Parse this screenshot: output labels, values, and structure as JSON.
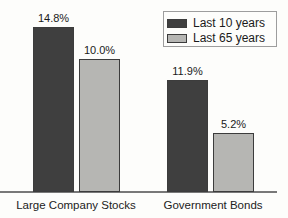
{
  "chart_data": {
    "type": "bar",
    "title": "",
    "xlabel": "",
    "ylabel": "",
    "grid": false,
    "legend_position": "top-right",
    "categories": [
      "Large Company Stocks",
      "Government Bonds"
    ],
    "series": [
      {
        "name": "Last 10 years",
        "color": "#3f3f3f",
        "values": [
          14.8,
          11.9
        ]
      },
      {
        "name": "Last 65 years",
        "color": "#b6b6b3",
        "values": [
          10.0,
          5.2
        ]
      }
    ],
    "value_labels": {
      "Last 10 years": [
        "14.8%",
        "11.9%"
      ],
      "Last 65 years": [
        "10.0%",
        "5.2%"
      ]
    },
    "ylim": [
      0,
      16
    ],
    "layout_px": {
      "baseline_y": 192,
      "bar_label_gap": 15,
      "bars": [
        {
          "series": 0,
          "category": 0,
          "label": "14.8%",
          "x": 33,
          "width": 41,
          "height": 165
        },
        {
          "series": 1,
          "category": 0,
          "label": "10.0%",
          "x": 79,
          "width": 41,
          "height": 133
        },
        {
          "series": 0,
          "category": 1,
          "label": "11.9%",
          "x": 167,
          "width": 41,
          "height": 112
        },
        {
          "series": 1,
          "category": 1,
          "label": "5.2%",
          "x": 213,
          "width": 41,
          "height": 59
        }
      ],
      "category_label_centers_x": [
        76,
        213
      ]
    }
  }
}
